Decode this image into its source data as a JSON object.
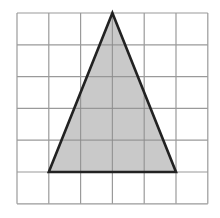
{
  "diagram": {
    "type": "grid-triangle",
    "grid": {
      "columns": 6,
      "rows": 6,
      "origin_px": [
        17,
        13
      ],
      "cell_px": 31.8,
      "line_color": "#9a9a9a"
    },
    "triangle": {
      "vertices_grid": [
        [
          3,
          0
        ],
        [
          1,
          5
        ],
        [
          5,
          5
        ]
      ],
      "fill": "#c9c9c9",
      "stroke": "#222222",
      "base_cells": 4,
      "height_cells": 5
    }
  }
}
